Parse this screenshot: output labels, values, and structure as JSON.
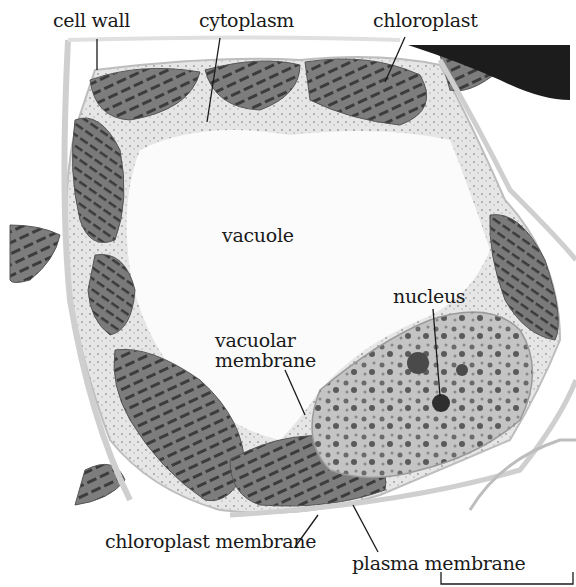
{
  "figure": {
    "labels": {
      "cell_wall": "cell wall",
      "cytoplasm": "cytoplasm",
      "chloroplast": "chloroplast",
      "vacuole": "vacuole",
      "nucleus": "nucleus",
      "vacuolar_membrane_line1": "vacuolar",
      "vacuolar_membrane_line2": "membrane",
      "chloroplast_membrane": "chloroplast membrane",
      "plasma_membrane": "plasma membrane"
    },
    "scale_bar": {
      "label": ""
    },
    "colors": {
      "background": "#ffffff",
      "chloroplast_fill": "#7a7a7a",
      "thylakoid": "#3a3a3a",
      "cytoplasm_fill": "#d9d9d9",
      "nucleus_fill": "#bdbdbd",
      "nucleolus": "#2e2e2e",
      "dark_cell": "#1c1c1c",
      "leader_line": "#1a1a1a"
    }
  }
}
